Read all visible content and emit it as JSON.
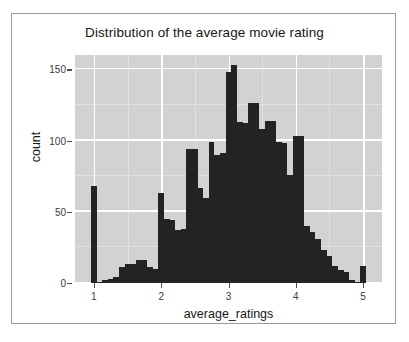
{
  "figure": {
    "title": "Distribution of the average movie rating",
    "panel_bg": "#d2d2d2",
    "bar_color": "#232323",
    "grid_color": "#ffffff",
    "frame_color": "#9a9a9a"
  },
  "chart_data": {
    "type": "bar",
    "title": "Distribution of the average movie rating",
    "xlabel": "average_ratings",
    "ylabel": "count",
    "grid": true,
    "legend": null,
    "xlim": [
      0.72,
      5.28
    ],
    "ylim": [
      0,
      160
    ],
    "xticks": [
      1,
      2,
      3,
      4,
      5
    ],
    "xtick_labels": [
      "1",
      "2",
      "3",
      "4",
      "5"
    ],
    "yticks": [
      0,
      50,
      100,
      150
    ],
    "ytick_labels": [
      "0",
      "50",
      "100",
      "150"
    ],
    "bin_width": 0.0833,
    "bins": [
      {
        "x": 1.0,
        "value": 68
      },
      {
        "x": 1.083,
        "value": 1
      },
      {
        "x": 1.167,
        "value": 2
      },
      {
        "x": 1.25,
        "value": 3
      },
      {
        "x": 1.333,
        "value": 4
      },
      {
        "x": 1.417,
        "value": 11
      },
      {
        "x": 1.5,
        "value": 13
      },
      {
        "x": 1.583,
        "value": 13
      },
      {
        "x": 1.667,
        "value": 16
      },
      {
        "x": 1.75,
        "value": 16
      },
      {
        "x": 1.833,
        "value": 11
      },
      {
        "x": 1.917,
        "value": 10
      },
      {
        "x": 2.0,
        "value": 63
      },
      {
        "x": 2.083,
        "value": 45
      },
      {
        "x": 2.167,
        "value": 44
      },
      {
        "x": 2.25,
        "value": 37
      },
      {
        "x": 2.333,
        "value": 38
      },
      {
        "x": 2.417,
        "value": 94
      },
      {
        "x": 2.5,
        "value": 94
      },
      {
        "x": 2.583,
        "value": 67
      },
      {
        "x": 2.667,
        "value": 60
      },
      {
        "x": 2.75,
        "value": 99
      },
      {
        "x": 2.833,
        "value": 90
      },
      {
        "x": 2.917,
        "value": 91
      },
      {
        "x": 3.0,
        "value": 148
      },
      {
        "x": 3.083,
        "value": 153
      },
      {
        "x": 3.167,
        "value": 113
      },
      {
        "x": 3.25,
        "value": 112
      },
      {
        "x": 3.333,
        "value": 126
      },
      {
        "x": 3.417,
        "value": 126
      },
      {
        "x": 3.5,
        "value": 108
      },
      {
        "x": 3.583,
        "value": 114
      },
      {
        "x": 3.667,
        "value": 114
      },
      {
        "x": 3.75,
        "value": 99
      },
      {
        "x": 3.833,
        "value": 98
      },
      {
        "x": 3.917,
        "value": 76
      },
      {
        "x": 4.0,
        "value": 103
      },
      {
        "x": 4.083,
        "value": 103
      },
      {
        "x": 4.167,
        "value": 40
      },
      {
        "x": 4.25,
        "value": 36
      },
      {
        "x": 4.333,
        "value": 31
      },
      {
        "x": 4.417,
        "value": 23
      },
      {
        "x": 4.5,
        "value": 19
      },
      {
        "x": 4.583,
        "value": 12
      },
      {
        "x": 4.667,
        "value": 9
      },
      {
        "x": 4.75,
        "value": 8
      },
      {
        "x": 4.833,
        "value": 2
      },
      {
        "x": 4.917,
        "value": 1
      },
      {
        "x": 5.0,
        "value": 12
      }
    ]
  }
}
